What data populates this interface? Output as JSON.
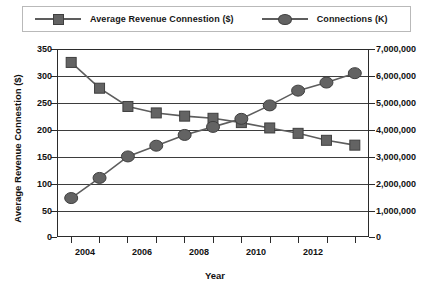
{
  "legend": {
    "entries": [
      {
        "label": "Average Revenue Connestion ($)",
        "marker": "square-marker",
        "color": "#636363"
      },
      {
        "label": "Connections (K)",
        "marker": "circle-marker",
        "color": "#636363"
      }
    ]
  },
  "axes": {
    "x_title": "Year",
    "y_left_title": "Average Revenue Connestion ($)",
    "y_right_title": "Connections (K)",
    "y_left_ticks": [
      "0",
      "50",
      "100",
      "150",
      "200",
      "250",
      "300",
      "350"
    ],
    "y_right_ticks": [
      "0",
      "1,000,000",
      "2,000,000",
      "3,000,000",
      "4,000,000",
      "5,000,000",
      "6,000,000",
      "7,000,000"
    ],
    "x_ticks": [
      "2004",
      "2006",
      "2008",
      "2010",
      "2012"
    ]
  },
  "colors": {
    "marker": "#636363",
    "marker_edge": "#3f3f3f",
    "line": "#5d5d5d",
    "grid": "#3d3d3d",
    "frame": "#2b2b2b"
  },
  "chart_data": {
    "type": "line",
    "title": "",
    "xlabel": "Year",
    "grid": true,
    "legend_position": "top",
    "x": [
      2003,
      2004,
      2005,
      2006,
      2007,
      2008,
      2009,
      2010,
      2011,
      2012,
      2013
    ],
    "xlim": [
      2002.5,
      2013.5
    ],
    "series": [
      {
        "name": "Average Revenue Connestion ($)",
        "axis": "left",
        "ylabel": "Average Revenue Connestion ($)",
        "ylim": [
          0,
          350
        ],
        "marker": "square",
        "values": [
          325,
          277,
          243,
          231,
          225,
          221,
          213,
          203,
          193,
          180,
          171
        ]
      },
      {
        "name": "Connections (K)",
        "axis": "right",
        "ylabel": "Connections (K)",
        "ylim": [
          0,
          7000000
        ],
        "marker": "circle",
        "values": [
          1450000,
          2200000,
          3000000,
          3400000,
          3800000,
          4100000,
          4400000,
          4900000,
          5450000,
          5750000,
          6100000
        ]
      }
    ]
  }
}
